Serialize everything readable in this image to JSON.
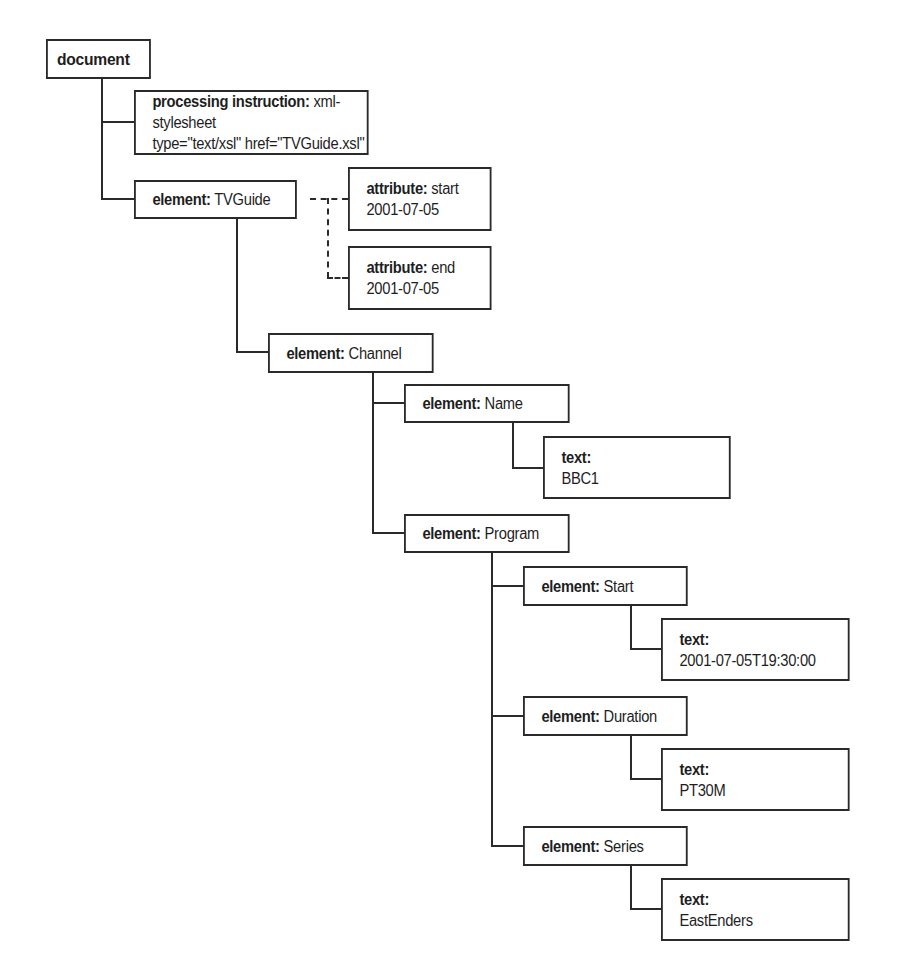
{
  "diagram": {
    "type": "xml-dom-tree",
    "nodes": {
      "document": {
        "kind": "document",
        "label": "document"
      },
      "pi": {
        "kind_label": "processing instruction:",
        "value": "xml-stylesheet",
        "line2": "type=\"text/xsl\" href=\"TVGuide.xsl\""
      },
      "tvguide": {
        "kind_label": "element:",
        "value": "TVGuide"
      },
      "attr_start": {
        "kind_label": "attribute:",
        "value": "start",
        "line2": "2001-07-05"
      },
      "attr_end": {
        "kind_label": "attribute:",
        "value": "end",
        "line2": "2001-07-05"
      },
      "channel": {
        "kind_label": "element:",
        "value": "Channel"
      },
      "name": {
        "kind_label": "element:",
        "value": "Name"
      },
      "name_text": {
        "kind_label": "text:",
        "line2": "BBC1"
      },
      "program": {
        "kind_label": "element:",
        "value": "Program"
      },
      "start": {
        "kind_label": "element:",
        "value": "Start"
      },
      "start_text": {
        "kind_label": "text:",
        "line2": "2001-07-05T19:30:00"
      },
      "duration": {
        "kind_label": "element:",
        "value": "Duration"
      },
      "duration_text": {
        "kind_label": "text:",
        "line2": "PT30M"
      },
      "series": {
        "kind_label": "element:",
        "value": "Series"
      },
      "series_text": {
        "kind_label": "text:",
        "line2": "EastEnders"
      }
    },
    "edges": [
      [
        "document",
        "pi"
      ],
      [
        "document",
        "tvguide"
      ],
      [
        "tvguide",
        "attr_start",
        "dashed"
      ],
      [
        "tvguide",
        "attr_end",
        "dashed"
      ],
      [
        "tvguide",
        "channel"
      ],
      [
        "channel",
        "name"
      ],
      [
        "name",
        "name_text"
      ],
      [
        "channel",
        "program"
      ],
      [
        "program",
        "start"
      ],
      [
        "start",
        "start_text"
      ],
      [
        "program",
        "duration"
      ],
      [
        "duration",
        "duration_text"
      ],
      [
        "program",
        "series"
      ],
      [
        "series",
        "series_text"
      ]
    ],
    "colors": {
      "stroke": "#2a2a2a",
      "text": "#1e1e1e",
      "background": "#ffffff"
    }
  }
}
